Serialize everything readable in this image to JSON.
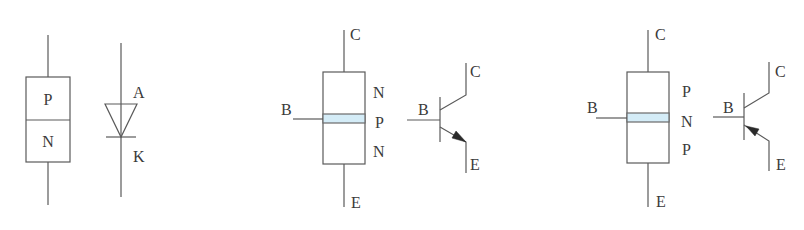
{
  "diagram": {
    "colors": {
      "line": "#5a5a5a",
      "text": "#3a3a3a",
      "base_band": "#d4ecf7"
    },
    "pn_junction": {
      "layers": [
        "P",
        "N"
      ]
    },
    "diode_symbol": {
      "anode_label": "A",
      "cathode_label": "K"
    },
    "npn_structure": {
      "collector_label": "C",
      "base_label": "B",
      "emitter_label": "E",
      "layers": [
        "N",
        "P",
        "N"
      ]
    },
    "npn_symbol": {
      "collector_label": "C",
      "base_label": "B",
      "emitter_label": "E",
      "arrow_direction": "outward"
    },
    "pnp_structure": {
      "collector_label": "C",
      "base_label": "B",
      "emitter_label": "E",
      "layers": [
        "P",
        "N",
        "P"
      ]
    },
    "pnp_symbol": {
      "collector_label": "C",
      "base_label": "B",
      "emitter_label": "E",
      "arrow_direction": "inward"
    }
  }
}
